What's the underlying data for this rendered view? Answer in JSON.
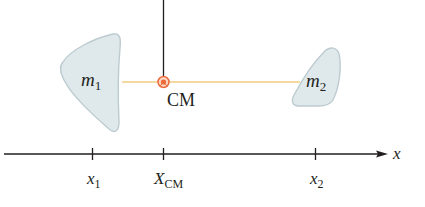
{
  "diagram": {
    "type": "center-of-mass",
    "colors": {
      "mass_fill": "#dfe9ec",
      "mass_stroke": "#b9c9ce",
      "rod": "#f3d9a0",
      "cm_marker": "#ef6a3a",
      "axis": "#231f20",
      "support_line": "#231f20"
    },
    "masses": [
      {
        "label_main": "m",
        "label_sub": "1"
      },
      {
        "label_main": "m",
        "label_sub": "2"
      }
    ],
    "cm_label": "CM",
    "axis": {
      "label": "x",
      "ticks": [
        {
          "main": "x",
          "sub": "1"
        },
        {
          "main": "X",
          "sub": "CM"
        },
        {
          "main": "x",
          "sub": "2"
        }
      ]
    }
  }
}
